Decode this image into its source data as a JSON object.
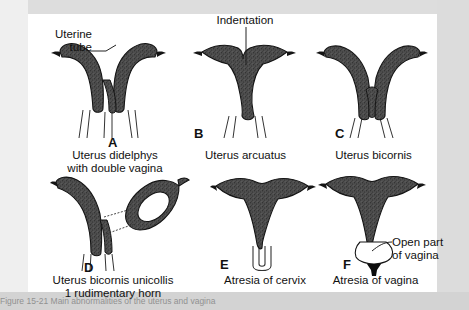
{
  "figure": {
    "title_caption": "Figure 15-21  Main abnormalities of the uterus and vagina",
    "background_color": "#d9d9d9",
    "panel_color": "#ffffff",
    "organ_fill_color": "#4a4a4a",
    "outline_color": "#111111"
  },
  "annotations": {
    "uterine_tube_line1": "Uterine",
    "uterine_tube_line2": "tube",
    "indentation": "Indentation",
    "open_part_line1": "Open part",
    "open_part_line2": "of vagina"
  },
  "panels": [
    {
      "letter": "A",
      "caption_line1": "Uterus didelphys",
      "caption_line2": "with double vagina",
      "icon": "uterus-didelphys-diagram"
    },
    {
      "letter": "B",
      "caption_line1": "Uterus arcuatus",
      "caption_line2": "",
      "icon": "uterus-arcuatus-diagram"
    },
    {
      "letter": "C",
      "caption_line1": "Uterus bicornis",
      "caption_line2": "",
      "icon": "uterus-bicornis-diagram"
    },
    {
      "letter": "D",
      "caption_line1": "Uterus bicornis unicollis",
      "caption_line2": "1 rudimentary horn",
      "icon": "uterus-bicornis-unicollis-diagram"
    },
    {
      "letter": "E",
      "caption_line1": "Atresia of cervix",
      "caption_line2": "",
      "icon": "atresia-of-cervix-diagram"
    },
    {
      "letter": "F",
      "caption_line1": "Atresia of vagina",
      "caption_line2": "",
      "icon": "atresia-of-vagina-diagram"
    }
  ]
}
